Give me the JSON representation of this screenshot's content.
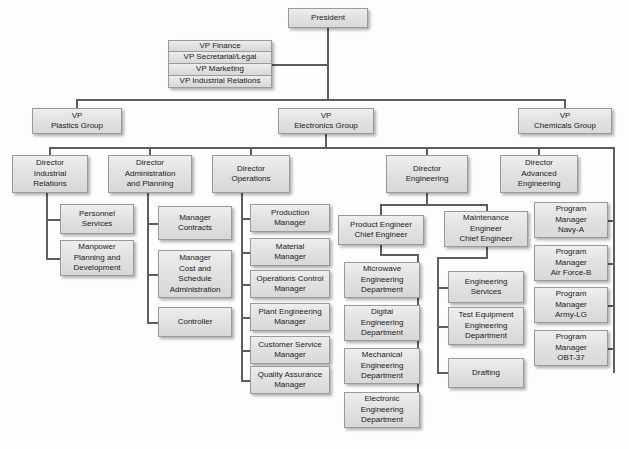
{
  "chart_data": {
    "type": "diagram",
    "diagram_kind": "organizational-hierarchy",
    "levels": 5
  },
  "nodes": {
    "president": {
      "label": "President",
      "x": 288,
      "y": 8,
      "w": 80,
      "h": 20
    },
    "staff": {
      "x": 168,
      "y": 40,
      "w": 104,
      "rowH": 12,
      "items": [
        {
          "label": "VP Finance"
        },
        {
          "label": "VP Secretarial/Legal"
        },
        {
          "label": "VP Marketing"
        },
        {
          "label": "VP Industrial Relations"
        }
      ]
    },
    "vps": [
      {
        "key": "vp-plastics",
        "label": "VP\nPlastics Group",
        "x": 32,
        "y": 108,
        "w": 90,
        "h": 26
      },
      {
        "key": "vp-electronics",
        "label": "VP\nElectronics Group",
        "x": 278,
        "y": 108,
        "w": 96,
        "h": 26
      },
      {
        "key": "vp-chemicals",
        "label": "VP\nChemicals Group",
        "x": 518,
        "y": 108,
        "w": 94,
        "h": 26
      }
    ],
    "directors": [
      {
        "key": "dir-industrial-relations",
        "label": "Director\nIndustrial\nRelations",
        "x": 12,
        "y": 155,
        "w": 76,
        "h": 38
      },
      {
        "key": "dir-administration",
        "label": "Director\nAdministration\nand Planning",
        "x": 108,
        "y": 155,
        "w": 84,
        "h": 38
      },
      {
        "key": "dir-operations",
        "label": "Director\nOperations",
        "x": 212,
        "y": 155,
        "w": 78,
        "h": 38
      },
      {
        "key": "dir-engineering",
        "label": "Director\nEngineering",
        "x": 386,
        "y": 155,
        "w": 82,
        "h": 38
      },
      {
        "key": "dir-advanced-engineering",
        "label": "Director\nAdvanced\nEngineering",
        "x": 500,
        "y": 155,
        "w": 78,
        "h": 38
      }
    ],
    "industrial_relations_units": [
      {
        "key": "personnel-services",
        "label": "Personnel\nServices",
        "x": 60,
        "y": 204,
        "w": 74,
        "h": 30
      },
      {
        "key": "manpower-planning",
        "label": "Manpower\nPlanning and\nDevelopment",
        "x": 60,
        "y": 240,
        "w": 74,
        "h": 36
      }
    ],
    "administration_units": [
      {
        "key": "manager-contracts",
        "label": "Manager\nContracts",
        "x": 158,
        "y": 206,
        "w": 74,
        "h": 34
      },
      {
        "key": "manager-cost-schedule",
        "label": "Manager\nCost and\nSchedule\nAdministration",
        "x": 158,
        "y": 250,
        "w": 74,
        "h": 48
      },
      {
        "key": "controller",
        "label": "Controller",
        "x": 158,
        "y": 307,
        "w": 74,
        "h": 30
      }
    ],
    "operations_units": [
      {
        "key": "production-manager",
        "label": "Production\nManager",
        "x": 250,
        "y": 204,
        "w": 80,
        "h": 28
      },
      {
        "key": "material-manager",
        "label": "Material\nManager",
        "x": 250,
        "y": 238,
        "w": 80,
        "h": 28
      },
      {
        "key": "operations-control-manager",
        "label": "Operations Control\nManager",
        "x": 250,
        "y": 270,
        "w": 80,
        "h": 28
      },
      {
        "key": "plant-engineering-manager",
        "label": "Plant Engineering\nManager",
        "x": 250,
        "y": 303,
        "w": 80,
        "h": 28
      },
      {
        "key": "customer-service-manager",
        "label": "Customer Service\nManager",
        "x": 250,
        "y": 336,
        "w": 80,
        "h": 28
      },
      {
        "key": "quality-assurance-manager",
        "label": "Quality Assurance\nManager",
        "x": 250,
        "y": 366,
        "w": 80,
        "h": 28
      }
    ],
    "product_engineering": {
      "head": {
        "key": "product-engineer-chief",
        "label": "Product Engineer\nChief Engineer",
        "x": 338,
        "y": 215,
        "w": 86,
        "h": 30
      },
      "departments": [
        {
          "key": "microwave-engineering-department",
          "label": "Microwave\nEngineering\nDepartment",
          "x": 344,
          "y": 262,
          "w": 76,
          "h": 36
        },
        {
          "key": "digital-engineering-department",
          "label": "Digital\nEngineering\nDepartment",
          "x": 344,
          "y": 305,
          "w": 76,
          "h": 36
        },
        {
          "key": "mechanical-engineering-department",
          "label": "Mechanical\nEngineering\nDepartment",
          "x": 344,
          "y": 348,
          "w": 76,
          "h": 36
        },
        {
          "key": "electronic-engineering-department",
          "label": "Electronic\nEngineering\nDepartment",
          "x": 344,
          "y": 392,
          "w": 76,
          "h": 36
        }
      ]
    },
    "maintenance_engineering": {
      "head": {
        "key": "maintenance-engineer-chief",
        "label": "Maintenance\nEngineer\nChief Engineer",
        "x": 444,
        "y": 211,
        "w": 84,
        "h": 36
      },
      "units": [
        {
          "key": "engineering-services",
          "label": "Engineering\nServices",
          "x": 448,
          "y": 271,
          "w": 76,
          "h": 32
        },
        {
          "key": "test-equipment-engineering",
          "label": "Test Equipment\nEngineering\nDepartment",
          "x": 448,
          "y": 307,
          "w": 76,
          "h": 38
        },
        {
          "key": "drafting",
          "label": "Drafting",
          "x": 448,
          "y": 358,
          "w": 76,
          "h": 30
        }
      ]
    },
    "program_managers": [
      {
        "key": "program-manager-navy-a",
        "label": "Program\nManager\nNavy-A",
        "x": 534,
        "y": 202,
        "w": 74,
        "h": 36
      },
      {
        "key": "program-manager-air-force-b",
        "label": "Program\nManager\nAir Force-B",
        "x": 534,
        "y": 245,
        "w": 74,
        "h": 36
      },
      {
        "key": "program-manager-army-lg",
        "label": "Program\nManager\nArmy-LG",
        "x": 534,
        "y": 287,
        "w": 74,
        "h": 36
      },
      {
        "key": "program-manager-obt-37",
        "label": "Program\nManager\nOBT-37",
        "x": 534,
        "y": 330,
        "w": 74,
        "h": 36
      }
    ]
  }
}
